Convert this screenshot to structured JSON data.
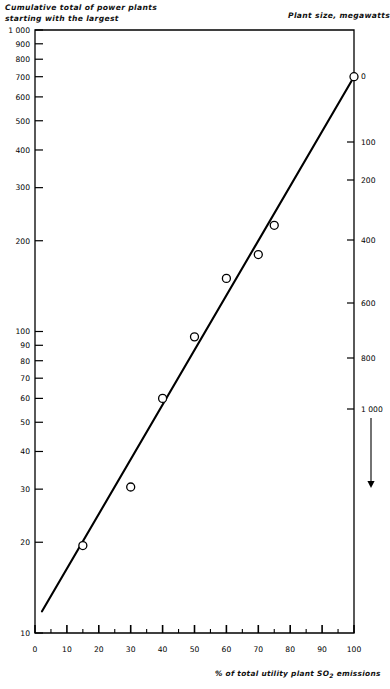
{
  "figure": {
    "title_left": [
      "Cumulative total of power plants",
      "starting with the largest"
    ],
    "title_right": "Plant size, megawatts",
    "xaxis_title_pre": "% of total utility plant SO",
    "xaxis_title_sub": "2",
    "xaxis_title_post": " emissions",
    "background": "#ffffff",
    "ink": "#000000"
  },
  "chart_data": {
    "type": "scatter",
    "title": "Cumulative total of power plants starting with the largest",
    "xlabel": "% of total utility plant SO2 emissions",
    "ylabel": "Cumulative total of power plants starting with the largest",
    "y2label": "Plant size, megawatts",
    "grid": false,
    "legend": null,
    "xlim": [
      0,
      100
    ],
    "xscale": "linear",
    "ylim": [
      10,
      1000
    ],
    "yscale": "log",
    "y2scale": "reversed-nonlinear",
    "x": [
      15,
      30,
      40,
      50,
      60,
      70,
      75,
      100
    ],
    "y": [
      19.5,
      30.5,
      60,
      96,
      150,
      180,
      225,
      700
    ],
    "points": [
      {
        "x": 15,
        "y": 19.5
      },
      {
        "x": 30,
        "y": 30.5
      },
      {
        "x": 40,
        "y": 60
      },
      {
        "x": 50,
        "y": 96
      },
      {
        "x": 60,
        "y": 150
      },
      {
        "x": 70,
        "y": 180
      },
      {
        "x": 75,
        "y": 225
      },
      {
        "x": 100,
        "y": 700
      }
    ],
    "trendline": {
      "x0": 2.2,
      "y0": 11.8,
      "x1": 100,
      "y1": 700
    },
    "xticks_major": [
      0,
      10,
      20,
      30,
      40,
      50,
      60,
      70,
      80,
      90,
      100
    ],
    "xticks_minor": [
      5,
      15,
      25,
      35,
      45,
      55,
      65,
      75,
      85,
      95
    ],
    "yticks_labeled": [
      10,
      20,
      30,
      40,
      50,
      60,
      70,
      80,
      90,
      100,
      200,
      300,
      400,
      500,
      600,
      700,
      800,
      900,
      1000
    ],
    "ytick_labels": [
      "10",
      "20",
      "30",
      "40",
      "50",
      "60",
      "70",
      "80",
      "90",
      "100",
      "200",
      "300",
      "400",
      "500",
      "600",
      "700",
      "800",
      "900",
      "1 000"
    ],
    "y2ticks": [
      {
        "label": "0",
        "pos": 76
      },
      {
        "label": "100",
        "pos": 142
      },
      {
        "label": "200",
        "pos": 180
      },
      {
        "label": "400",
        "pos": 240
      },
      {
        "label": "600",
        "pos": 303
      },
      {
        "label": "800",
        "pos": 358
      },
      {
        "label": "1 000",
        "pos": 409
      }
    ],
    "y2_arrow": {
      "note": "downward arrow below 1 000 indicating increasing plant size",
      "x": 371,
      "y_from": 418,
      "y_to": 488
    }
  }
}
